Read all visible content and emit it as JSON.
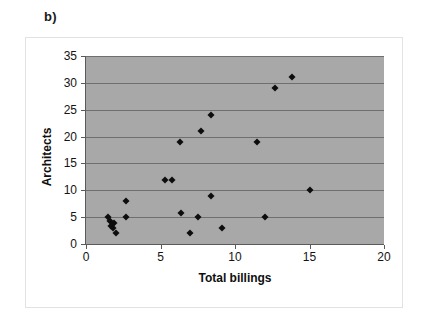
{
  "panel": {
    "label": "b)"
  },
  "chart_data": {
    "type": "scatter",
    "title": "",
    "xlabel": "Total billings",
    "ylabel": "Architects",
    "xlim": [
      0,
      20
    ],
    "ylim": [
      0,
      35
    ],
    "xticks": [
      0,
      5,
      10,
      15,
      20
    ],
    "yticks": [
      0,
      5,
      10,
      15,
      20,
      25,
      30,
      35
    ],
    "grid": "horizontal",
    "legend": "none",
    "plot_background_color": "#a8a8a8",
    "marker_color": "#0d0d0d",
    "marker_shape": "diamond",
    "points": [
      {
        "x": 1.5,
        "y": 5.0
      },
      {
        "x": 1.6,
        "y": 4.2
      },
      {
        "x": 1.7,
        "y": 3.4
      },
      {
        "x": 1.9,
        "y": 4.0
      },
      {
        "x": 1.8,
        "y": 3.0
      },
      {
        "x": 2.0,
        "y": 2.0
      },
      {
        "x": 2.7,
        "y": 8.0
      },
      {
        "x": 2.7,
        "y": 5.0
      },
      {
        "x": 5.3,
        "y": 12.0
      },
      {
        "x": 5.8,
        "y": 12.0
      },
      {
        "x": 6.3,
        "y": 19.0
      },
      {
        "x": 6.4,
        "y": 5.8
      },
      {
        "x": 7.0,
        "y": 2.0
      },
      {
        "x": 7.5,
        "y": 5.0
      },
      {
        "x": 7.7,
        "y": 21.0
      },
      {
        "x": 8.4,
        "y": 24.0
      },
      {
        "x": 8.4,
        "y": 9.0
      },
      {
        "x": 9.1,
        "y": 3.0
      },
      {
        "x": 11.5,
        "y": 19.0
      },
      {
        "x": 12.0,
        "y": 5.0
      },
      {
        "x": 12.7,
        "y": 29.0
      },
      {
        "x": 13.8,
        "y": 31.0
      },
      {
        "x": 15.0,
        "y": 10.0
      }
    ]
  }
}
